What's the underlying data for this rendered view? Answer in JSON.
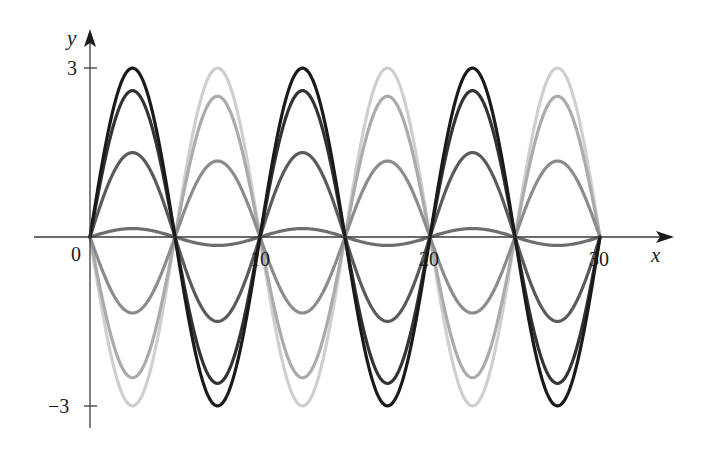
{
  "chart_data": {
    "type": "line",
    "title": "",
    "xlabel": "x",
    "ylabel": "y",
    "xlim": [
      0,
      31.5
    ],
    "ylim": [
      -3.2,
      3.3
    ],
    "x_ticks": [
      {
        "value": 0,
        "label": "0"
      },
      {
        "value": 10,
        "label": "10"
      },
      {
        "value": 20,
        "label": "20"
      },
      {
        "value": 30,
        "label": "30"
      }
    ],
    "y_ticks": [
      {
        "value": 3,
        "label": "3"
      },
      {
        "value": -3,
        "label": "−3"
      }
    ],
    "grid": false,
    "legend": null,
    "function_form": "y = A sin(πx/5)",
    "x_range": [
      0,
      30
    ],
    "series": [
      {
        "name": "A = 3",
        "amplitude": 3,
        "color": "#1a1a1a"
      },
      {
        "name": "A = 2.6",
        "amplitude": 2.6,
        "color": "#333333"
      },
      {
        "name": "A = 1.5",
        "amplitude": 1.5,
        "color": "#5a5a5a"
      },
      {
        "name": "A = 0.15",
        "amplitude": 0.15,
        "color": "#6e6e6e"
      },
      {
        "name": "A = -1.35",
        "amplitude": -1.35,
        "color": "#8c8c8c"
      },
      {
        "name": "A = -2.5",
        "amplitude": -2.5,
        "color": "#ababab"
      },
      {
        "name": "A = -3",
        "amplitude": -3,
        "color": "#cfcfcf"
      }
    ],
    "zero_crossings": [
      0,
      5,
      10,
      15,
      20,
      25,
      30
    ]
  },
  "labels": {
    "x_axis": "x",
    "y_axis": "y",
    "origin": "0",
    "x10": "10",
    "x20": "20",
    "x30": "30",
    "y3": "3",
    "yneg3": "−3"
  }
}
